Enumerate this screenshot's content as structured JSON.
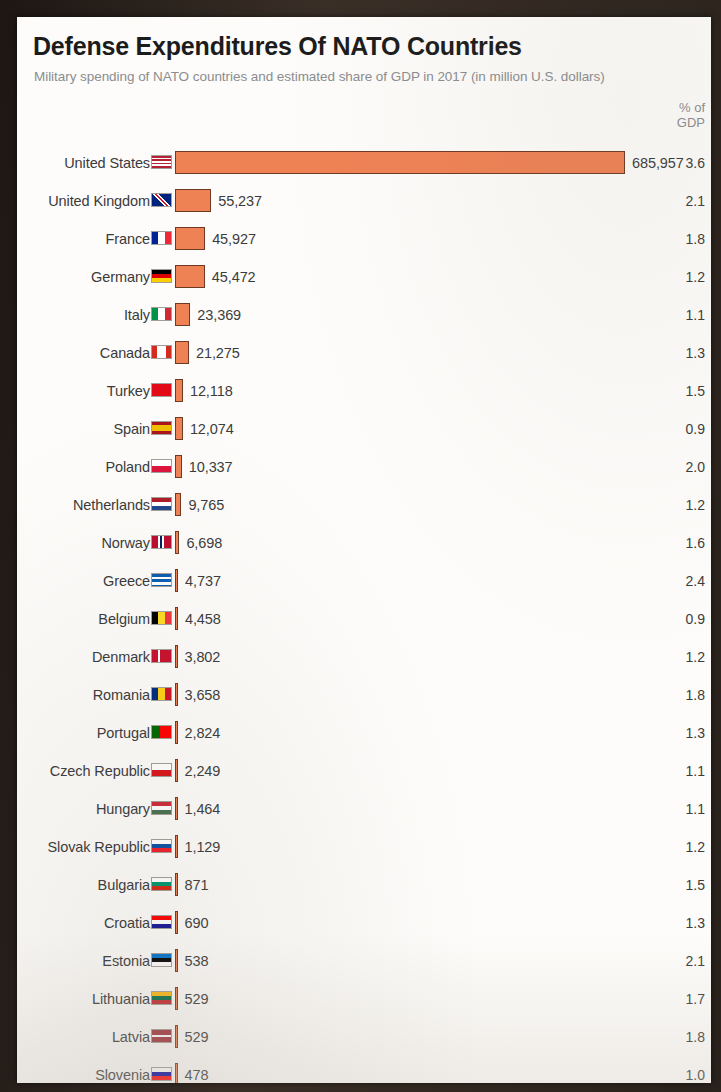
{
  "header": {
    "title": "Defense Expenditures Of NATO Countries",
    "subtitle": "Military spending of NATO countries and estimated share of GDP in 2017 (in million U.S. dollars)",
    "gdp_column_line1": "% of",
    "gdp_column_line2": "GDP"
  },
  "chart_data": {
    "type": "bar",
    "title": "Defense Expenditures Of NATO Countries",
    "subtitle": "Military spending of NATO countries and estimated share of GDP in 2017 (in million U.S. dollars)",
    "orientation": "horizontal",
    "xlabel": "",
    "ylabel": "",
    "unit": "million U.S. dollars",
    "year": 2017,
    "bar_color": "#ef8255",
    "bar_border_color": "#6e3a21",
    "grid": false,
    "legend": false,
    "value_axis_max": 685957,
    "categories": [
      "United States",
      "United Kingdom",
      "France",
      "Germany",
      "Italy",
      "Canada",
      "Turkey",
      "Spain",
      "Poland",
      "Netherlands",
      "Norway",
      "Greece",
      "Belgium",
      "Denmark",
      "Romania",
      "Portugal",
      "Czech Republic",
      "Hungary",
      "Slovak Republic",
      "Bulgaria",
      "Croatia",
      "Estonia",
      "Lithuania",
      "Latvia",
      "Slovenia"
    ],
    "series": [
      {
        "name": "Military spending",
        "values": [
          685957,
          55237,
          45927,
          45472,
          23369,
          21275,
          12118,
          12074,
          10337,
          9765,
          6698,
          4737,
          4458,
          3802,
          3658,
          2824,
          2249,
          1464,
          1129,
          871,
          690,
          538,
          529,
          529,
          478
        ]
      },
      {
        "name": "% of GDP",
        "values": [
          3.6,
          2.1,
          1.8,
          1.2,
          1.1,
          1.3,
          1.5,
          0.9,
          2.0,
          1.2,
          1.6,
          2.4,
          0.9,
          1.2,
          1.8,
          1.3,
          1.1,
          1.1,
          1.2,
          1.5,
          1.3,
          2.1,
          1.7,
          1.8,
          1.0
        ]
      }
    ]
  },
  "rows": [
    {
      "country": "United States",
      "value": "685,957",
      "gdp": "3.6",
      "amount": 685957,
      "flag": "flag-us"
    },
    {
      "country": "United Kingdom",
      "value": "55,237",
      "gdp": "2.1",
      "amount": 55237,
      "flag": "flag-gb"
    },
    {
      "country": "France",
      "value": "45,927",
      "gdp": "1.8",
      "amount": 45927,
      "flag": "flag-fr"
    },
    {
      "country": "Germany",
      "value": "45,472",
      "gdp": "1.2",
      "amount": 45472,
      "flag": "flag-de"
    },
    {
      "country": "Italy",
      "value": "23,369",
      "gdp": "1.1",
      "amount": 23369,
      "flag": "flag-it"
    },
    {
      "country": "Canada",
      "value": "21,275",
      "gdp": "1.3",
      "amount": 21275,
      "flag": "flag-ca"
    },
    {
      "country": "Turkey",
      "value": "12,118",
      "gdp": "1.5",
      "amount": 12118,
      "flag": "flag-tr"
    },
    {
      "country": "Spain",
      "value": "12,074",
      "gdp": "0.9",
      "amount": 12074,
      "flag": "flag-es"
    },
    {
      "country": "Poland",
      "value": "10,337",
      "gdp": "2.0",
      "amount": 10337,
      "flag": "flag-pl"
    },
    {
      "country": "Netherlands",
      "value": "9,765",
      "gdp": "1.2",
      "amount": 9765,
      "flag": "flag-nl"
    },
    {
      "country": "Norway",
      "value": "6,698",
      "gdp": "1.6",
      "amount": 6698,
      "flag": "flag-no"
    },
    {
      "country": "Greece",
      "value": "4,737",
      "gdp": "2.4",
      "amount": 4737,
      "flag": "flag-gr"
    },
    {
      "country": "Belgium",
      "value": "4,458",
      "gdp": "0.9",
      "amount": 4458,
      "flag": "flag-be"
    },
    {
      "country": "Denmark",
      "value": "3,802",
      "gdp": "1.2",
      "amount": 3802,
      "flag": "flag-dk"
    },
    {
      "country": "Romania",
      "value": "3,658",
      "gdp": "1.8",
      "amount": 3658,
      "flag": "flag-ro"
    },
    {
      "country": "Portugal",
      "value": "2,824",
      "gdp": "1.3",
      "amount": 2824,
      "flag": "flag-pt"
    },
    {
      "country": "Czech Republic",
      "value": "2,249",
      "gdp": "1.1",
      "amount": 2249,
      "flag": "flag-cz"
    },
    {
      "country": "Hungary",
      "value": "1,464",
      "gdp": "1.1",
      "amount": 1464,
      "flag": "flag-hu"
    },
    {
      "country": "Slovak Republic",
      "value": "1,129",
      "gdp": "1.2",
      "amount": 1129,
      "flag": "flag-sk"
    },
    {
      "country": "Bulgaria",
      "value": "871",
      "gdp": "1.5",
      "amount": 871,
      "flag": "flag-bg"
    },
    {
      "country": "Croatia",
      "value": "690",
      "gdp": "1.3",
      "amount": 690,
      "flag": "flag-hr"
    },
    {
      "country": "Estonia",
      "value": "538",
      "gdp": "2.1",
      "amount": 538,
      "flag": "flag-ee"
    },
    {
      "country": "Lithuania",
      "value": "529",
      "gdp": "1.7",
      "amount": 529,
      "flag": "flag-lt"
    },
    {
      "country": "Latvia",
      "value": "529",
      "gdp": "1.8",
      "amount": 529,
      "flag": "flag-lv"
    },
    {
      "country": "Slovenia",
      "value": "478",
      "gdp": "1.0",
      "amount": 478,
      "flag": "flag-si"
    }
  ]
}
